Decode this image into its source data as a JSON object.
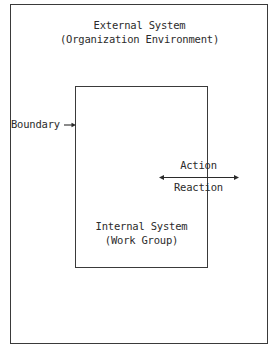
{
  "diagram": {
    "stroke_color": "#3a3a3a",
    "text_color": "#2b2b2b",
    "background_color": "#ffffff",
    "outer_box": {
      "name": "External System",
      "line1": "External System",
      "line2": "(Organization Environment)"
    },
    "inner_box": {
      "name": "Internal System",
      "line1": "Internal System",
      "line2": "(Work Group)"
    },
    "boundary": {
      "label": "Boundary",
      "arrow": "right-arrow-icon"
    },
    "interaction": {
      "action_label": "Action",
      "reaction_label": "Reaction",
      "arrow": "double-headed-arrow-icon"
    }
  }
}
